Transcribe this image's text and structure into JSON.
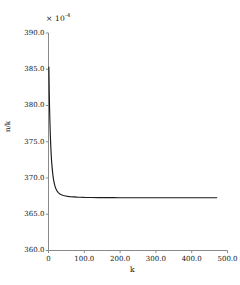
{
  "chart_data": {
    "type": "line",
    "title": "",
    "xlabel": "k",
    "ylabel": "n/k",
    "y_multiplier": "× 10",
    "y_multiplier_exponent": "-4",
    "grid": false,
    "legend": null,
    "xlim": [
      0,
      500
    ],
    "ylim": [
      360.0,
      390.0
    ],
    "xticks": [
      "0",
      "100.0",
      "200.0",
      "300.0",
      "400.0",
      "500.0"
    ],
    "xtick_values": [
      0,
      100,
      200,
      300,
      400,
      500
    ],
    "yticks": [
      "360.0",
      "365.0",
      "370.0",
      "375.0",
      "380.0",
      "385.0",
      "390.0"
    ],
    "ytick_values": [
      360.0,
      365.0,
      370.0,
      375.0,
      380.0,
      385.0,
      390.0
    ],
    "series": [
      {
        "name": "n/k",
        "color": "#1a1a1a",
        "x": [
          1,
          2,
          3,
          4,
          5,
          6,
          7,
          8,
          9,
          10,
          12,
          14,
          16,
          18,
          20,
          24,
          28,
          32,
          36,
          40,
          45,
          50,
          55,
          60,
          70,
          80,
          90,
          100,
          120,
          140,
          160,
          180,
          200,
          240,
          280,
          320,
          360,
          400,
          440,
          470
        ],
        "y": [
          385.3,
          382.0,
          379.6,
          377.7,
          376.1,
          374.8,
          373.7,
          372.8,
          372.1,
          371.5,
          370.5,
          369.8,
          369.3,
          368.9,
          368.6,
          368.2,
          367.95,
          367.8,
          367.7,
          367.62,
          367.55,
          367.5,
          367.46,
          367.43,
          367.39,
          367.36,
          367.35,
          367.33,
          367.31,
          367.3,
          367.29,
          367.29,
          367.28,
          367.28,
          367.27,
          367.27,
          367.27,
          367.27,
          367.27,
          367.27
        ]
      }
    ]
  },
  "axes": {
    "axis_color": "#8a8a8a",
    "curve_color": "#1a1a1a"
  }
}
